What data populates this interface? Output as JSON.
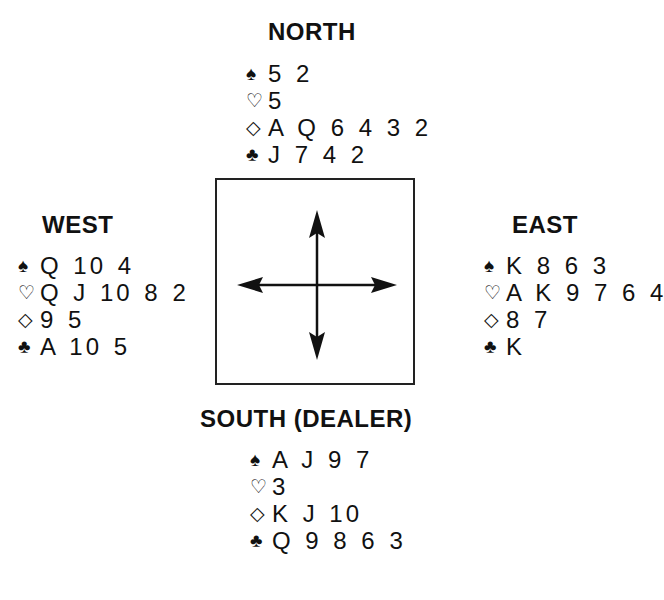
{
  "hands": {
    "north": {
      "label": "NORTH",
      "spades": "5 2",
      "hearts": "5",
      "diamonds": "A Q 6 4 3 2",
      "clubs": "J 7 4 2"
    },
    "west": {
      "label": "WEST",
      "spades": "Q 10 4",
      "hearts": "Q J 10 8 2",
      "diamonds": "9 5",
      "clubs": "A 10 5"
    },
    "east": {
      "label": "EAST",
      "spades": "K 8 6 3",
      "hearts": "A K 9 7 6 4",
      "diamonds": "8 7",
      "clubs": "K"
    },
    "south": {
      "label": "SOUTH (DEALER)",
      "spades": "A J 9 7",
      "hearts": "3",
      "diamonds": "K J 10",
      "clubs": "Q 9 8 6 3"
    }
  },
  "suit_symbols": {
    "spades": "♠",
    "hearts": "♡",
    "diamonds": "◇",
    "clubs": "♣"
  }
}
